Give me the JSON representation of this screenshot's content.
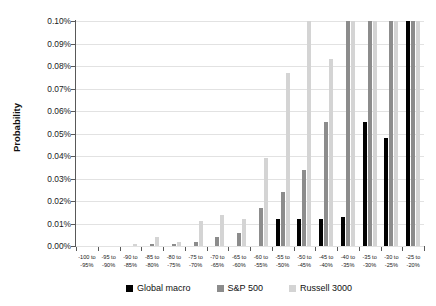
{
  "chart_data": {
    "type": "bar",
    "title": "",
    "xlabel": "",
    "ylabel": "Probability",
    "ylim": [
      0,
      0.001
    ],
    "ytick_labels": [
      "0.00%",
      "0.01%",
      "0.02%",
      "0.03%",
      "0.04%",
      "0.05%",
      "0.06%",
      "0.07%",
      "0.08%",
      "0.09%",
      "0.10%"
    ],
    "ytick_values": [
      0.0,
      0.01,
      0.02,
      0.03,
      0.04,
      0.05,
      0.06,
      0.07,
      0.08,
      0.09,
      0.1
    ],
    "y_max_percent": 0.1,
    "grid": true,
    "legend_position": "bottom",
    "value_unit": "percent",
    "note_clipped": "Bars exceeding 0.10% are clipped at the top of the plot area.",
    "categories": [
      "-100 to -95%",
      "-95 to -90%",
      "-90 to -85%",
      "-85 to -80%",
      "-80 to -75%",
      "-75 to -70%",
      "-70 to -65%",
      "-65 to -60%",
      "-60 to -55%",
      "-55 to -50%",
      "-50 to -45%",
      "-45 to -40%",
      "-40 to -35%",
      "-35 to -30%",
      "-30 to -25%",
      "-25 to -20%"
    ],
    "category_lines": [
      [
        "-100 to",
        "-95%"
      ],
      [
        "-95 to",
        "-90%"
      ],
      [
        "-90 to",
        "-85%"
      ],
      [
        "-85 to",
        "-80%"
      ],
      [
        "-80 to",
        "-75%"
      ],
      [
        "-75 to",
        "-70%"
      ],
      [
        "-70 to",
        "-65%"
      ],
      [
        "-65 to",
        "-60%"
      ],
      [
        "-60 to",
        "-55%"
      ],
      [
        "-55 to",
        "-50%"
      ],
      [
        "-50 to",
        "-45%"
      ],
      [
        "-45 to",
        "-40%"
      ],
      [
        "-40 to",
        "-35%"
      ],
      [
        "-35 to",
        "-30%"
      ],
      [
        "-30 to",
        "-25%"
      ],
      [
        "-25 to",
        "-20%"
      ]
    ],
    "series": [
      {
        "name": "Global macro",
        "color": "#000000",
        "values": [
          0,
          0,
          0,
          0,
          0,
          0,
          0,
          0,
          0,
          0.012,
          0.012,
          0.012,
          0.013,
          0.055,
          0.048,
          0.1
        ]
      },
      {
        "name": "S&P 500",
        "color": "#8c8c8c",
        "values": [
          0,
          0,
          0,
          0.001,
          0.001,
          0.002,
          0.004,
          0.006,
          0.017,
          0.024,
          0.034,
          0.055,
          0.1,
          0.1,
          0.1,
          0.1
        ]
      },
      {
        "name": "Russell 3000",
        "color": "#d4d4d4",
        "values": [
          0,
          0,
          0.001,
          0.004,
          0.002,
          0.011,
          0.014,
          0.012,
          0.039,
          0.077,
          0.1,
          0.083,
          0.1,
          0.1,
          0.1,
          0.1
        ]
      }
    ]
  },
  "legend": {
    "items": [
      {
        "label": "Global macro",
        "color": "#000000"
      },
      {
        "label": "S&P 500",
        "color": "#8c8c8c"
      },
      {
        "label": "Russell 3000",
        "color": "#d4d4d4"
      }
    ]
  }
}
